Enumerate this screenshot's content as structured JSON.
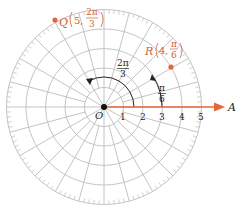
{
  "diagram": {
    "type": "polar-grid",
    "center_label": "O",
    "axis_label": "A",
    "radial_ticks": [
      "1",
      "2",
      "3",
      "4",
      "5"
    ],
    "max_radius": 5,
    "angle_step_deg": 15,
    "colors": {
      "grid": "#c4c4c4",
      "axis": "#e2683a",
      "point": "#e2683a",
      "point_label": "#d2603a",
      "ink": "#222222"
    },
    "points": [
      {
        "name": "Q",
        "r": "5",
        "theta_num": "2π",
        "theta_den": "3",
        "r_value": 5,
        "theta_deg": 120
      },
      {
        "name": "R",
        "r": "4",
        "theta_num": "π",
        "theta_den": "6",
        "r_value": 4,
        "theta_deg": 30
      }
    ],
    "angle_markers": [
      {
        "num": "2π",
        "den": "3",
        "theta_deg": 120
      },
      {
        "num": "π",
        "den": "6",
        "theta_deg": 30
      }
    ]
  }
}
